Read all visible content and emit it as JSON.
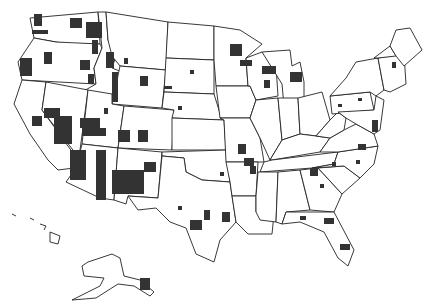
{
  "map": {
    "title": "",
    "type": "choropleth",
    "region": "United States (counties)",
    "colors": {
      "background": "#ffffff",
      "state_border": "#222222",
      "highlighted_county": "#333333",
      "unhighlighted": "#ffffff"
    },
    "states": [
      {
        "name": "Washington",
        "d": "M30,18 L98,12 L100,44 L70,44 L56,42 L34,38 Z"
      },
      {
        "name": "Oregon",
        "d": "M34,38 L56,42 L100,44 L102,48 L94,68 L96,84 L22,80 L18,62 Z"
      },
      {
        "name": "California",
        "d": "M22,80 L46,82 L42,110 L78,160 L74,168 L58,170 L48,160 L30,134 L14,104 Z"
      },
      {
        "name": "Idaho",
        "d": "M98,12 L106,12 L108,40 L116,56 L112,68 L122,72 L118,98 L82,92 L96,84 L94,68 L102,48 Z"
      },
      {
        "name": "Nevada",
        "d": "M46,82 L88,90 L80,150 L76,154 L42,110 Z"
      },
      {
        "name": "Montana",
        "d": "M106,12 L168,22 L166,70 L120,66 L112,56 L108,40 Z"
      },
      {
        "name": "Wyoming",
        "d": "M120,66 L166,70 L162,108 L112,104 Z"
      },
      {
        "name": "Utah",
        "d": "M88,90 L112,94 L112,104 L124,106 L118,148 L82,144 Z"
      },
      {
        "name": "Arizona",
        "d": "M82,144 L118,148 L114,200 L100,198 L66,182 L76,168 L78,160 Z"
      },
      {
        "name": "Colorado",
        "d": "M124,106 L174,110 L172,150 L118,148 Z"
      },
      {
        "name": "New Mexico",
        "d": "M118,148 L162,152 L158,198 L128,196 L126,204 L114,200 Z"
      },
      {
        "name": "North Dakota",
        "d": "M168,22 L214,26 L214,60 L166,58 Z"
      },
      {
        "name": "South Dakota",
        "d": "M166,58 L214,60 L214,94 L164,92 Z"
      },
      {
        "name": "Nebraska",
        "d": "M164,92 L214,94 L222,120 L172,118 L174,110 L162,108 Z"
      },
      {
        "name": "Kansas",
        "d": "M172,118 L224,120 L226,150 L172,150 Z"
      },
      {
        "name": "Oklahoma",
        "d": "M162,152 L226,150 L230,182 L202,180 L186,172 L184,158 L162,156 Z"
      },
      {
        "name": "Texas",
        "d": "M162,156 L184,158 L186,172 L202,180 L230,182 L236,222 L220,240 L214,262 L196,254 L186,228 L170,222 L156,208 L138,210 L128,196 L158,198 Z"
      },
      {
        "name": "Minnesota",
        "d": "M214,26 L240,30 L262,44 L246,58 L248,86 L216,86 L214,60 Z"
      },
      {
        "name": "Iowa",
        "d": "M216,86 L250,86 L256,100 L250,118 L220,118 Z"
      },
      {
        "name": "Missouri",
        "d": "M220,118 L250,118 L260,138 L264,162 L226,162 L224,120 Z"
      },
      {
        "name": "Arkansas",
        "d": "M226,162 L258,162 L256,196 L232,196 L230,182 Z"
      },
      {
        "name": "Louisiana",
        "d": "M232,196 L256,196 L256,212 L274,214 L272,234 L248,234 L236,222 Z"
      },
      {
        "name": "Wisconsin",
        "d": "M246,58 L262,52 L276,66 L278,96 L256,100 L250,86 L248,86 Z"
      },
      {
        "name": "Illinois",
        "d": "M256,100 L278,98 L282,140 L270,160 L260,138 L250,118 Z"
      },
      {
        "name": "Michigan",
        "d": "M262,52 L290,50 L292,66 L300,62 L304,82 L304,104 L284,106 L282,84 Z"
      },
      {
        "name": "Indiana",
        "d": "M278,98 L298,98 L300,134 L282,140 Z"
      },
      {
        "name": "Ohio",
        "d": "M298,98 L322,92 L330,120 L316,136 L300,134 Z"
      },
      {
        "name": "Kentucky",
        "d": "M270,160 L282,140 L300,134 L316,136 L330,138 L320,152 L272,160 Z"
      },
      {
        "name": "Tennessee",
        "d": "M264,162 L272,160 L338,152 L334,164 L312,168 L260,172 Z"
      },
      {
        "name": "Mississippi",
        "d": "M258,172 L278,172 L276,222 L260,220 L256,212 L256,196 Z"
      },
      {
        "name": "Alabama",
        "d": "M278,172 L300,170 L310,210 L286,212 L282,224 L276,222 Z"
      },
      {
        "name": "Georgia",
        "d": "M300,170 L318,168 L342,194 L334,212 L310,210 Z"
      },
      {
        "name": "Florida",
        "d": "M282,224 L286,212 L334,212 L354,250 L348,266 L338,258 L324,232 L300,222 Z"
      },
      {
        "name": "South Carolina",
        "d": "M318,168 L344,166 L360,178 L342,194 Z"
      },
      {
        "name": "North Carolina",
        "d": "M312,168 L334,164 L338,152 L378,146 L374,164 L360,178 L344,166 Z"
      },
      {
        "name": "Virginia",
        "d": "M320,152 L330,138 L344,130 L356,124 L374,134 L378,146 L338,152 Z"
      },
      {
        "name": "West Virginia",
        "d": "M316,136 L330,120 L338,112 L346,118 L344,130 L330,138 Z"
      },
      {
        "name": "Pennsylvania",
        "d": "M330,96 L370,92 L374,110 L332,114 Z"
      },
      {
        "name": "New York",
        "d": "M330,96 L346,78 L356,62 L378,58 L384,90 L376,96 L370,92 Z"
      },
      {
        "name": "Maryland-Delaware-NJ",
        "d": "M346,118 L338,112 L374,110 L376,96 L384,100 L380,130 L374,134 L356,124 Z"
      },
      {
        "name": "New England South",
        "d": "M378,58 L404,54 L406,84 L390,92 L384,90 Z"
      },
      {
        "name": "Vermont-NH",
        "d": "M374,58 L390,46 L396,56 L378,58 Z"
      },
      {
        "name": "Maine",
        "d": "M390,46 L396,30 L410,28 L422,50 L404,66 L396,56 Z"
      }
    ],
    "insets": [
      {
        "name": "Alaska",
        "d": "M88,262 L112,254 L120,258 L124,276 L140,280 L154,292 L150,296 L134,286 L118,284 L96,298 L72,300 L100,286 L104,278 L84,276 L82,266 Z"
      },
      {
        "name": "Hawaii",
        "d": "M12,214 L16,216 M30,218 L34,220 M40,224 L46,226 L44,230 M50,232 L60,236 L58,244 L50,242 Z"
      }
    ],
    "highlighted_counties": [
      {
        "x": 34,
        "y": 14,
        "w": 8,
        "h": 12
      },
      {
        "x": 32,
        "y": 30,
        "w": 16,
        "h": 4
      },
      {
        "x": 70,
        "y": 18,
        "w": 12,
        "h": 10
      },
      {
        "x": 86,
        "y": 22,
        "w": 16,
        "h": 16
      },
      {
        "x": 92,
        "y": 40,
        "w": 6,
        "h": 14
      },
      {
        "x": 20,
        "y": 58,
        "w": 12,
        "h": 18
      },
      {
        "x": 44,
        "y": 52,
        "w": 8,
        "h": 12
      },
      {
        "x": 80,
        "y": 60,
        "w": 10,
        "h": 10
      },
      {
        "x": 106,
        "y": 52,
        "w": 8,
        "h": 16
      },
      {
        "x": 124,
        "y": 58,
        "w": 4,
        "h": 6
      },
      {
        "x": 112,
        "y": 72,
        "w": 6,
        "h": 30
      },
      {
        "x": 88,
        "y": 74,
        "w": 6,
        "h": 10
      },
      {
        "x": 140,
        "y": 76,
        "w": 8,
        "h": 10
      },
      {
        "x": 164,
        "y": 86,
        "w": 8,
        "h": 3
      },
      {
        "x": 190,
        "y": 70,
        "w": 4,
        "h": 4
      },
      {
        "x": 178,
        "y": 106,
        "w": 4,
        "h": 4
      },
      {
        "x": 44,
        "y": 108,
        "w": 16,
        "h": 10
      },
      {
        "x": 54,
        "y": 116,
        "w": 18,
        "h": 28
      },
      {
        "x": 32,
        "y": 116,
        "w": 10,
        "h": 10
      },
      {
        "x": 80,
        "y": 118,
        "w": 20,
        "h": 10
      },
      {
        "x": 82,
        "y": 128,
        "w": 24,
        "h": 8
      },
      {
        "x": 104,
        "y": 108,
        "w": 4,
        "h": 6
      },
      {
        "x": 118,
        "y": 130,
        "w": 12,
        "h": 12
      },
      {
        "x": 138,
        "y": 130,
        "w": 10,
        "h": 12
      },
      {
        "x": 70,
        "y": 150,
        "w": 16,
        "h": 30
      },
      {
        "x": 96,
        "y": 150,
        "w": 10,
        "h": 50
      },
      {
        "x": 112,
        "y": 170,
        "w": 32,
        "h": 24
      },
      {
        "x": 144,
        "y": 162,
        "w": 12,
        "h": 10
      },
      {
        "x": 178,
        "y": 206,
        "w": 4,
        "h": 4
      },
      {
        "x": 190,
        "y": 220,
        "w": 12,
        "h": 10
      },
      {
        "x": 204,
        "y": 210,
        "w": 6,
        "h": 10
      },
      {
        "x": 222,
        "y": 212,
        "w": 8,
        "h": 10
      },
      {
        "x": 230,
        "y": 44,
        "w": 12,
        "h": 12
      },
      {
        "x": 240,
        "y": 60,
        "w": 12,
        "h": 6
      },
      {
        "x": 262,
        "y": 66,
        "w": 14,
        "h": 8
      },
      {
        "x": 264,
        "y": 80,
        "w": 6,
        "h": 8
      },
      {
        "x": 290,
        "y": 72,
        "w": 12,
        "h": 10
      },
      {
        "x": 238,
        "y": 144,
        "w": 8,
        "h": 10
      },
      {
        "x": 244,
        "y": 158,
        "w": 10,
        "h": 8
      },
      {
        "x": 250,
        "y": 166,
        "w": 6,
        "h": 8
      },
      {
        "x": 220,
        "y": 172,
        "w": 4,
        "h": 4
      },
      {
        "x": 310,
        "y": 168,
        "w": 8,
        "h": 8
      },
      {
        "x": 320,
        "y": 184,
        "w": 4,
        "h": 4
      },
      {
        "x": 332,
        "y": 162,
        "w": 4,
        "h": 4
      },
      {
        "x": 300,
        "y": 216,
        "w": 6,
        "h": 4
      },
      {
        "x": 324,
        "y": 218,
        "w": 10,
        "h": 6
      },
      {
        "x": 340,
        "y": 244,
        "w": 10,
        "h": 6
      },
      {
        "x": 356,
        "y": 160,
        "w": 4,
        "h": 4
      },
      {
        "x": 358,
        "y": 144,
        "w": 8,
        "h": 6
      },
      {
        "x": 372,
        "y": 120,
        "w": 6,
        "h": 12
      },
      {
        "x": 338,
        "y": 104,
        "w": 4,
        "h": 3
      },
      {
        "x": 358,
        "y": 98,
        "w": 4,
        "h": 3
      },
      {
        "x": 392,
        "y": 62,
        "w": 4,
        "h": 6
      },
      {
        "x": 140,
        "y": 278,
        "w": 10,
        "h": 12
      }
    ]
  }
}
